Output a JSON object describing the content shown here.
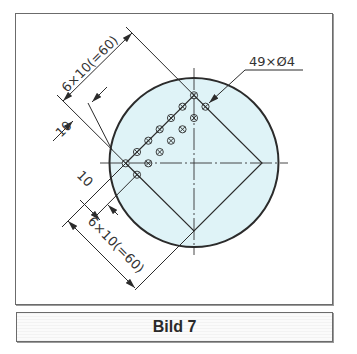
{
  "figure": {
    "caption": "Bild 7",
    "callout_holes": "49×Ø4",
    "dim_top": "6×10(=60)",
    "dim_bottom": "6×10(=60)",
    "dim_pitch_upper": "10",
    "dim_pitch_lower": "10"
  },
  "colors": {
    "disc_fill": "#dff3f7",
    "line": "#2b2b2b",
    "frame": "#6b6b6b"
  }
}
